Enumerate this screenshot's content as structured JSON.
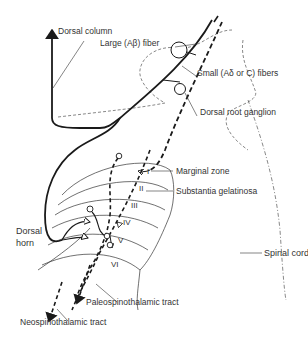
{
  "diagram": {
    "labels": {
      "dorsal_column": "Dorsal column",
      "large_fiber": "Large (Aβ) fiber",
      "small_fibers": "Small (Aδ or C) fibers",
      "dorsal_root_ganglion": "Dorsal root ganglion",
      "marginal_zone": "Marginal zone",
      "substantia_gelatinosa": "Substantia gelatinosa",
      "dorsal_horn_line1": "Dorsal",
      "dorsal_horn_line2": "horn",
      "spinal_cord": "Spinal cord",
      "paleospinothalamic_tract": "Paleospinothalamic tract",
      "neospinothalamic_tract": "Neospinothalamic tract"
    },
    "laminae": [
      "I",
      "II",
      "III",
      "IV",
      "V",
      "VI"
    ],
    "colors": {
      "ink": "#1a1a1a",
      "text": "#333333",
      "background": "#ffffff"
    }
  }
}
